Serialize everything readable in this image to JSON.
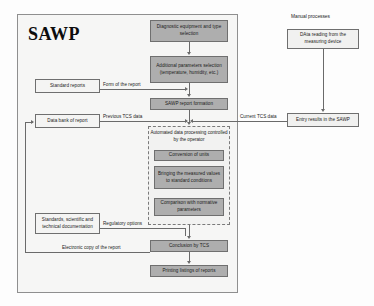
{
  "diagram": {
    "title": "SAWP",
    "manual_section_title": "Manual processes"
  },
  "nodes": {
    "diagnostic_equipment": "Diagnostic equipment and type selection",
    "additional_parameters": "Additional parameters selection (temperature, humidity, etc.)",
    "sawp_report_formation": "SAWP report formation",
    "automated_processing": "Automated data processing controlled by the operator",
    "conversion_of_units": "Conversion of units",
    "bringing_measured_values": "Bringing the measured values to standard conditions",
    "comparison_normative": "Comparison with normative parameters",
    "conclusion_tcs": "Conclusion by TCS",
    "printing_listings": "Printing listings of reports",
    "standard_reports": "Standard reports",
    "data_bank_of_report": "Data bank of report",
    "standards_documentation": "Standards, scientific and technical documentation",
    "data_reading": "DAta reading  from the measuring device",
    "entry_results": "Entry results in the SAWP"
  },
  "edge_labels": {
    "form_of_report": "Form of the report",
    "previous_tcs_data": "Previous TCS data",
    "current_tcs_data": "Current TCS data",
    "regulatory_options": "Regulatory options",
    "electronic_copy": "Electronic copy of the report"
  },
  "colors": {
    "process_fill": "#aeaeae",
    "input_fill": "#f4f4f3",
    "border": "#6f6f6f",
    "container_fill": "#f6f6f5",
    "connector": "#6a6a6a"
  }
}
